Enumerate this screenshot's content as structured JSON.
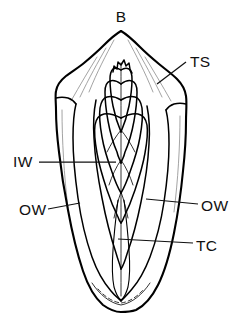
{
  "figure": {
    "background_color": "#ffffff",
    "line_color": "#000000",
    "text_color": "#111111",
    "fill_color": "#ffffff",
    "texture": "stipple",
    "width": 243,
    "height": 325
  },
  "labels": {
    "bud": {
      "text": "B",
      "x": 121,
      "y": 22,
      "anchor": "middle",
      "has_leader": false
    },
    "terminal_spike": {
      "text": "TS",
      "x": 190,
      "y": 67,
      "anchor": "start",
      "has_leader": true,
      "leader": {
        "x1": 186,
        "y1": 62,
        "x2": 157,
        "y2": 84
      }
    },
    "inner_wall": {
      "text": "IW",
      "x": 13,
      "y": 167,
      "anchor": "start",
      "has_leader": true,
      "leader": {
        "x1": 39,
        "y1": 162,
        "x2": 116,
        "y2": 162
      }
    },
    "outer_wall_left": {
      "text": "OW",
      "x": 19,
      "y": 215,
      "anchor": "start",
      "has_leader": true,
      "leader": {
        "x1": 48,
        "y1": 209,
        "x2": 80,
        "y2": 203
      }
    },
    "outer_wall_right": {
      "text": "OW",
      "x": 201,
      "y": 211,
      "anchor": "start",
      "has_leader": true,
      "leader": {
        "x1": 198,
        "y1": 204,
        "x2": 146,
        "y2": 199
      }
    },
    "tissue_core": {
      "text": "TC",
      "x": 196,
      "y": 251,
      "anchor": "start",
      "has_leader": true,
      "leader": {
        "x1": 193,
        "y1": 243,
        "x2": 118,
        "y2": 239
      }
    }
  },
  "legend_keys": [
    {
      "abbr": "B",
      "meaning": "B"
    },
    {
      "abbr": "TS",
      "meaning": "TS"
    },
    {
      "abbr": "IW",
      "meaning": "IW"
    },
    {
      "abbr": "OW",
      "meaning": "OW"
    },
    {
      "abbr": "TC",
      "meaning": "TC"
    }
  ]
}
